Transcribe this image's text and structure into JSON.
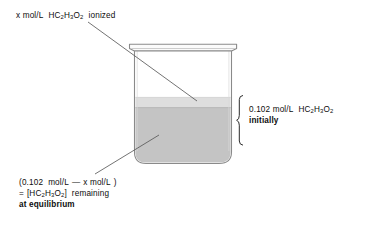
{
  "diagram": {
    "background_color": "#ffffff",
    "text_color": "#0d0d0d"
  },
  "labels": {
    "top": {
      "name": "ionized-label",
      "text": "x mol/L  HC2H3O2  ionized",
      "parts": {
        "lead": "x mol/L",
        "formula_h": "HC",
        "sub1": "2",
        "formula_h2": "H",
        "sub2": "3",
        "formula_o": "O",
        "sub3": "2",
        "trail": "ionized"
      }
    },
    "right": {
      "name": "initial-concentration-label",
      "line1": "0.102 mol/L  HC2H3O2",
      "line2": "initially",
      "parts": {
        "value": "0.102 mol/L",
        "formula_h": "HC",
        "sub1": "2",
        "formula_h2": "H",
        "sub2": "3",
        "formula_o": "O",
        "sub3": "2",
        "bold_line": "initially"
      }
    },
    "bottom": {
      "name": "equilibrium-concentration-label",
      "line1": "(0.102  mol/L — x mol/L )",
      "line2": "= [HC2H3O2] remaining",
      "line3": "at equilibrium",
      "parts": {
        "open_paren": "(0.102",
        "unit1": "mol/L",
        "minus": "—",
        "x_term": "x mol/L",
        "close_paren": ")",
        "equals": "=",
        "bracket_open": "[HC",
        "sub1": "2",
        "formula_h2": "H",
        "sub2": "3",
        "formula_o": "O",
        "sub3": "2",
        "bracket_close": "]",
        "remaining": "remaining",
        "bold_line": "at equilibrium"
      }
    }
  },
  "beaker": {
    "name": "beaker",
    "outline_color": "#8a8a8a",
    "rim_fill": "#fbfbfb",
    "glass_fill": "#ffffff",
    "liquid_surface_color": "#dedede",
    "liquid_body_color": "#c4c4c4",
    "liquid_body_edge_color": "#b3b3b3"
  },
  "brace": {
    "name": "height-brace",
    "color": "#2b2b2b"
  },
  "leader_lines": {
    "color": "#5a5a5a",
    "top_line": {
      "from_x": 88,
      "from_y": 22,
      "to_x": 197,
      "to_y": 101
    },
    "bottom_line": {
      "from_x": 95,
      "from_y": 174,
      "to_x": 159,
      "to_y": 135
    }
  }
}
